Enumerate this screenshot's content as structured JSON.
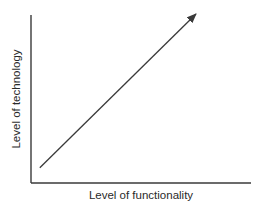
{
  "chart_data": {
    "type": "line",
    "title": "",
    "xlabel": "Level of functionality",
    "ylabel": "Level of technology",
    "xlim": [
      0,
      1
    ],
    "ylim": [
      0,
      1
    ],
    "grid": false,
    "legend": "none",
    "series": [
      {
        "name": "trend",
        "x": [
          0.04,
          0.75
        ],
        "y": [
          0.09,
          1.0
        ],
        "arrow_end": true
      }
    ]
  },
  "colors": {
    "ink": "#3a3a3a"
  }
}
